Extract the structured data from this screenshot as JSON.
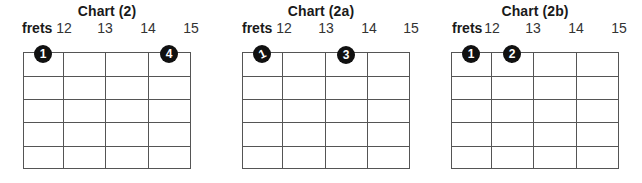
{
  "charts": [
    {
      "title": "Chart (2)",
      "frets_label": "frets",
      "fret_numbers": [
        "12",
        "13",
        "14",
        "15"
      ],
      "strings": 6,
      "fret_columns": 4,
      "dots": [
        {
          "finger": "1",
          "string": 1,
          "fret": 12,
          "marking": "normal"
        },
        {
          "finger": "4",
          "string": 1,
          "fret": 15,
          "marking": "normal"
        }
      ]
    },
    {
      "title": "Chart (2a)",
      "frets_label": "frets",
      "fret_numbers": [
        "12",
        "13",
        "14",
        "15"
      ],
      "strings": 6,
      "fret_columns": 4,
      "dots": [
        {
          "finger": "1",
          "string": 1,
          "fret": 12,
          "marking": "slide"
        },
        {
          "finger": "3",
          "string": 1,
          "fret": 14,
          "marking": "normal"
        }
      ]
    },
    {
      "title": "Chart (2b)",
      "frets_label": "frets",
      "fret_numbers": [
        "12",
        "13",
        "14",
        "15"
      ],
      "strings": 6,
      "fret_columns": 4,
      "dots": [
        {
          "finger": "1",
          "string": 1,
          "fret": 12,
          "marking": "normal"
        },
        {
          "finger": "2",
          "string": 1,
          "fret": 13,
          "marking": "normal"
        }
      ]
    }
  ],
  "colors": {
    "dot": "#111111",
    "dot_text": "#ffffff",
    "grid": "#555555",
    "text": "#1a1a1a"
  }
}
